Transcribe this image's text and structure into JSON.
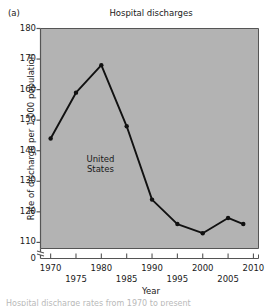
{
  "figure": {
    "panel_label": "(a)",
    "caption_partial": "Hospital discharge rates from 1970 to present"
  },
  "chart_data": {
    "type": "line",
    "title": "Hospital discharges",
    "xlabel": "Year",
    "ylabel": "Rate of discharge per 1,000 population",
    "series": [
      {
        "name": "United States",
        "x": [
          1970,
          1975,
          1980,
          1985,
          1990,
          1995,
          2000,
          2005,
          2008
        ],
        "values": [
          144,
          159,
          168,
          148,
          124,
          116,
          113,
          118,
          116
        ]
      }
    ],
    "annotations": [
      {
        "text_line1": "United",
        "text_line2": "States",
        "x": 1981,
        "y": 137
      }
    ],
    "xlim": [
      1968,
      2011
    ],
    "ylim": [
      108,
      180
    ],
    "ytick_labels": [
      "180",
      "170",
      "160",
      "150",
      "140",
      "130",
      "120",
      "110",
      "0"
    ],
    "ytick_values": [
      180,
      170,
      160,
      150,
      140,
      130,
      120,
      110,
      0
    ],
    "xtick_labels_upper": [
      "1970",
      "1980",
      "1990",
      "2000",
      "2010"
    ],
    "xtick_values_upper": [
      1970,
      1980,
      1990,
      2000,
      2010
    ],
    "xtick_labels_lower": [
      "1975",
      "1985",
      "1995",
      "2005"
    ],
    "xtick_values_lower": [
      1975,
      1985,
      1995,
      2005
    ],
    "grid": false,
    "legend": "none",
    "axis_break": true,
    "plot_background_color": "#b3b3b3",
    "line_color": "#111111",
    "marker_color": "#111111",
    "axis_color": "#555555"
  }
}
